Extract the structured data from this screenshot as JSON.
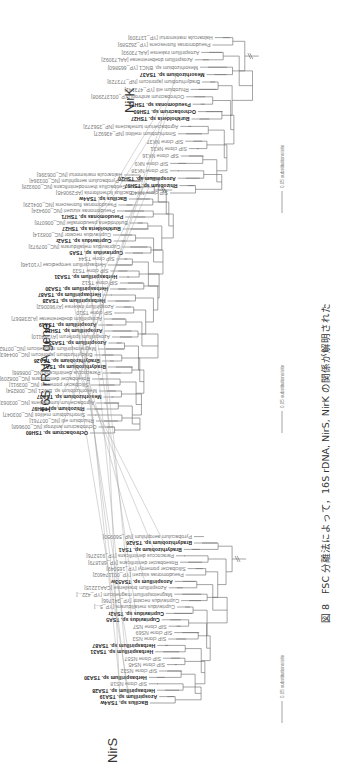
{
  "figure": {
    "caption": "図 8　FSC 分離法によって，16S rDNA, NirS, NirK の関係が解明された",
    "scale_label": "0.05 substitutions/site"
  },
  "trees": {
    "nirs": {
      "title": "NirS",
      "leaves": [
        {
          "label": "Bacillus sp. TSA4w",
          "bold": true
        },
        {
          "label": "Azospirillum sp. TSA19",
          "bold": true
        },
        {
          "label": "Herbaspirillum sp. TSA28",
          "bold": true
        },
        {
          "label": "SIP clone NS18",
          "bold": false
        },
        {
          "label": "Herbaspirillum sp. TSA30",
          "bold": true
        },
        {
          "label": "SIP clone NS32",
          "bold": false
        },
        {
          "label": "SIP clone NS45",
          "bold": false
        },
        {
          "label": "SIP clone NS57",
          "bold": false
        },
        {
          "label": "Herbaspirillum sp. TSA31",
          "bold": true
        },
        {
          "label": "Herbaspirillum sp. TSA87",
          "bold": true
        },
        {
          "label": "SIP clone NS3",
          "bold": false
        },
        {
          "label": "SIP clone NS69",
          "bold": false
        },
        {
          "label": "SIP clone NS7",
          "bold": false
        },
        {
          "label": "Cupriavidus sp. TSA5",
          "bold": true
        },
        {
          "label": "Cupriavidus sp. TSA2r",
          "bold": true
        },
        {
          "label": "Cupriavidus metallidurans [YP_5...]",
          "bold": false
        },
        {
          "label": "Cupriavidus necator [YP_341766]",
          "bold": false
        },
        {
          "label": "Magnetospirillum magneticum [YP_422...]",
          "bold": false
        },
        {
          "label": "Azospirillum brasilense [CAA12215]",
          "bold": false
        },
        {
          "label": "Azospirillum sp. TSA53w",
          "bold": true
        },
        {
          "label": "Pseudomonas stutzeri [YP_001174602]",
          "bold": false
        },
        {
          "label": "Silicibacter pomeroyi [YP_165049]",
          "bold": false
        },
        {
          "label": "Roseobacter denitrificans [YP_681879]",
          "bold": false
        },
        {
          "label": "Paracoccus denitrificans [YP_915276]",
          "bold": false
        },
        {
          "label": "Bradyrhizobium sp. TSA1",
          "bold": true
        },
        {
          "label": "Bradyrhizobium sp. TSA26",
          "bold": true
        },
        {
          "label": "Pyrobaculum aerophilum [NP_560950]",
          "bold": false
        }
      ]
    },
    "rrna16s": {
      "title": "16S rRNA gene",
      "leaves": [
        {
          "label": "Ochrobactrum sp. TSH60",
          "bold": true
        },
        {
          "label": "Ochrobactrum anthropi [NC_009668]",
          "bold": false
        },
        {
          "label": "Rhizobium etli [NC_007761]",
          "bold": false
        },
        {
          "label": "Sinorhizobium meliloti [NC_003047]",
          "bold": false
        },
        {
          "label": "Rhizobium sp. TSH97",
          "bold": true
        },
        {
          "label": "Agrobacterium tumefaciens [NC_003063]",
          "bold": false
        },
        {
          "label": "Mesorhizobium sp. TSA37",
          "bold": true
        },
        {
          "label": "Mesorhizobium sp. BNC1 [NC_008254]",
          "bold": false
        },
        {
          "label": "Silicibacter pomeroyi [NC_003911]",
          "bold": false
        },
        {
          "label": "Roseobacter denitrificans [NC_008209]",
          "bold": false
        },
        {
          "label": "Paracoccus denitrificans [NC_008686]",
          "bold": false
        },
        {
          "label": "Bradyrhizobium sp. TSA1",
          "bold": true
        },
        {
          "label": "Bradyrhizobium sp. TSA26",
          "bold": true
        },
        {
          "label": "Bradyrhizobium japonicum [NC_004463]",
          "bold": false
        },
        {
          "label": "Magnetospirillum magneticum [NC_007626]",
          "bold": false
        },
        {
          "label": "Azospirillum sp. TSA53w",
          "bold": true
        },
        {
          "label": "Azospirillum lipoferum [AY324110]",
          "bold": false
        },
        {
          "label": "Azospirillum sp. TSH20",
          "bold": true
        },
        {
          "label": "Azospirillum sp. TSA19",
          "bold": true
        },
        {
          "label": "Azospirillum doebereinerae [AJ238567]",
          "bold": false
        },
        {
          "label": "SIP clone TS10",
          "bold": false
        },
        {
          "label": "Azospirillum irakense [AY960062]",
          "bold": false
        },
        {
          "label": "Herbaspirillum sp. TSA28",
          "bold": true
        },
        {
          "label": "Herbaspirillum sp. TSA87",
          "bold": true
        },
        {
          "label": "Herbaspirillum sp. TSA30",
          "bold": true
        },
        {
          "label": "SIP clone TS12",
          "bold": false
        },
        {
          "label": "Herbaspirillum sp. TSA31",
          "bold": true
        },
        {
          "label": "SIP clone TS33",
          "bold": false
        },
        {
          "label": "Herbaspirillum seropedicae [Y10146]",
          "bold": false
        },
        {
          "label": "SIP clone TS44",
          "bold": false
        },
        {
          "label": "Cupriavidus sp. TSA5",
          "bold": true
        },
        {
          "label": "Cupriavidus metallidurans [NC_007973]",
          "bold": false
        },
        {
          "label": "Cupriavidus sp. TSA2r",
          "bold": true
        },
        {
          "label": "Cupriavidus necator [NC_008314]",
          "bold": false
        },
        {
          "label": "Burkholderia sp. TSH27",
          "bold": true
        },
        {
          "label": "Burkholderia pseudomallei [NC_006078]",
          "bold": false
        },
        {
          "label": "Pseudomonas sp. TSH71",
          "bold": true
        },
        {
          "label": "Pseudomonas stutzeri [NC_009434]",
          "bold": false
        },
        {
          "label": "Pseudomonas fluorescens [NC_004129]",
          "bold": false
        },
        {
          "label": "Bacillus sp. TSA4w",
          "bold": true
        },
        {
          "label": "Bacillus licheniformis [AF290845]",
          "bold": false
        },
        {
          "label": "Geobacillus thermodenitrificans [NC_009328]",
          "bold": false
        },
        {
          "label": "Pyrobaculum aerophilum [NC_003364]",
          "bold": false
        },
        {
          "label": "Haloarcula marismortui [NC_006396]",
          "bold": false
        }
      ]
    },
    "nirk": {
      "title": "NirK",
      "leaves": [
        {
          "label": "SIP clone NK40",
          "bold": false
        },
        {
          "label": "Rhizobium sp. TSH97",
          "bold": true
        },
        {
          "label": "Azospirillum sp. TSH20",
          "bold": true
        },
        {
          "label": "SIP clone NK38",
          "bold": false
        },
        {
          "label": "SIP clone NK9",
          "bold": false
        },
        {
          "label": "SIP clone NK16",
          "bold": false
        },
        {
          "label": "SIP clone NK31",
          "bold": false
        },
        {
          "label": "SIP clone NK37",
          "bold": false
        },
        {
          "label": "Sinorhizobium meliloti [NP_436927]",
          "bold": false
        },
        {
          "label": "Agrobacterium tumefaciens [NP_356273]",
          "bold": false
        },
        {
          "label": "Burkholderia sp. TSH27",
          "bold": true
        },
        {
          "label": "Ochrobactrum sp. TSH60",
          "bold": true
        },
        {
          "label": "Pseudomonas sp. TSH71",
          "bold": true
        },
        {
          "label": "Ochrobactrum anthropi [YP_001372908]",
          "bold": false
        },
        {
          "label": "Rhizobium etli [YP_473141]",
          "bold": false
        },
        {
          "label": "Bradyrhizobium japonicum [NP_773729]",
          "bold": false
        },
        {
          "label": "Mesorhizobium sp. TSA37",
          "bold": true
        },
        {
          "label": "Mesorhizobium sp. BNC1 [YP_665860]",
          "bold": false
        },
        {
          "label": "Azospirillum doebereinerae [AAL73092]",
          "bold": false
        },
        {
          "label": "Azospirillum irakense [AAL73093]",
          "bold": false
        },
        {
          "label": "Pseudomonas fluorescens [YP_262589]",
          "bold": false
        },
        {
          "label": "Haloarcula marismortui [YP_137309]",
          "bold": false
        }
      ]
    }
  },
  "links": [
    [
      "nirs",
      "Bacillus sp. TSA4w",
      "rrna16s",
      "Bacillus sp. TSA4w"
    ],
    [
      "nirs",
      "Azospirillum sp. TSA19",
      "rrna16s",
      "Azospirillum sp. TSA19"
    ],
    [
      "nirs",
      "Herbaspirillum sp. TSA28",
      "rrna16s",
      "Herbaspirillum sp. TSA28"
    ],
    [
      "nirs",
      "Herbaspirillum sp. TSA30",
      "rrna16s",
      "Herbaspirillum sp. TSA30"
    ],
    [
      "nirs",
      "Herbaspirillum sp. TSA31",
      "rrna16s",
      "Herbaspirillum sp. TSA31"
    ],
    [
      "nirs",
      "Herbaspirillum sp. TSA87",
      "rrna16s",
      "Herbaspirillum sp. TSA87"
    ],
    [
      "nirs",
      "Cupriavidus sp. TSA5",
      "rrna16s",
      "Cupriavidus sp. TSA5"
    ],
    [
      "nirs",
      "Cupriavidus sp. TSA2r",
      "rrna16s",
      "Cupriavidus sp. TSA2r"
    ],
    [
      "nirs",
      "Azospirillum sp. TSA53w",
      "rrna16s",
      "Azospirillum sp. TSA53w"
    ],
    [
      "nirs",
      "Bradyrhizobium sp. TSA1",
      "rrna16s",
      "Bradyrhizobium sp. TSA1"
    ],
    [
      "nirs",
      "Bradyrhizobium sp. TSA26",
      "rrna16s",
      "Bradyrhizobium sp. TSA26"
    ],
    [
      "rrna16s",
      "Ochrobactrum sp. TSH60",
      "nirk",
      "Ochrobactrum sp. TSH60"
    ],
    [
      "rrna16s",
      "Rhizobium sp. TSH97",
      "nirk",
      "Rhizobium sp. TSH97"
    ],
    [
      "rrna16s",
      "Mesorhizobium sp. TSA37",
      "nirk",
      "Mesorhizobium sp. TSA37"
    ],
    [
      "rrna16s",
      "Azospirillum sp. TSH20",
      "nirk",
      "Azospirillum sp. TSH20"
    ],
    [
      "rrna16s",
      "Burkholderia sp. TSH27",
      "nirk",
      "Burkholderia sp. TSH27"
    ],
    [
      "rrna16s",
      "Pseudomonas sp. TSH71",
      "nirk",
      "Pseudomonas sp. TSH71"
    ]
  ]
}
